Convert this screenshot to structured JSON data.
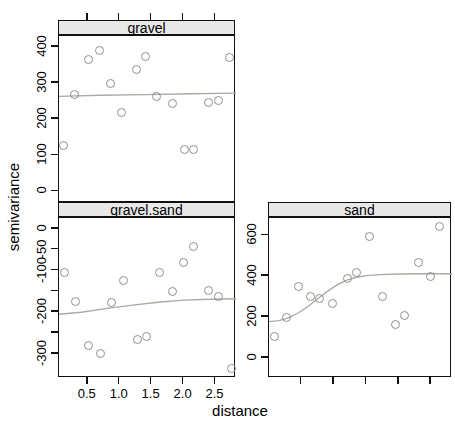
{
  "figure": {
    "xlab": "distance",
    "ylab": "semivariance"
  },
  "colors": {
    "point_stroke": "#8f8f8f",
    "model_line": "#a7ada0",
    "strip_bg": "#e8e8e8",
    "border": "#111111",
    "text": "#000000"
  },
  "chart_data": [
    {
      "type": "scatter",
      "panel_title": "gravel",
      "xlabel": "distance",
      "ylabel": "semivariance",
      "xlim": [
        0.05,
        2.82
      ],
      "ylim": [
        -32,
        430
      ],
      "x_ticks": [
        0.5,
        1.0,
        1.5,
        2.0,
        2.5
      ],
      "x_tick_labels": [
        "",
        "",
        "",
        "",
        ""
      ],
      "x_tick_side": "top",
      "y_ticks": [
        0,
        100,
        200,
        300,
        400
      ],
      "y_tick_labels": [
        "0",
        "100",
        "200",
        "300",
        "400"
      ],
      "grid": false,
      "points": [
        [
          0.13,
          125
        ],
        [
          0.3,
          268
        ],
        [
          0.52,
          364
        ],
        [
          0.69,
          389
        ],
        [
          0.86,
          298
        ],
        [
          1.03,
          218
        ],
        [
          1.27,
          337
        ],
        [
          1.41,
          372
        ],
        [
          1.59,
          260
        ],
        [
          1.83,
          243
        ],
        [
          2.02,
          114
        ],
        [
          2.16,
          114
        ],
        [
          2.39,
          246
        ],
        [
          2.55,
          251
        ],
        [
          2.73,
          369
        ]
      ],
      "model_line": [
        [
          0.05,
          263
        ],
        [
          0.7,
          266
        ],
        [
          1.4,
          268
        ],
        [
          2.1,
          270
        ],
        [
          2.82,
          272
        ]
      ]
    },
    {
      "type": "scatter",
      "panel_title": "gravel.sand",
      "xlabel": "distance",
      "ylabel": "semivariance",
      "xlim": [
        0.05,
        2.82
      ],
      "ylim": [
        -358,
        26
      ],
      "x_ticks": [
        0.5,
        1.0,
        1.5,
        2.0,
        2.5
      ],
      "x_tick_labels": [
        "0.5",
        "1.0",
        "1.5",
        "2.0",
        "2.5"
      ],
      "x_tick_side": "bottom",
      "y_ticks": [
        0,
        -50,
        -100,
        -150,
        -200,
        -250,
        -300
      ],
      "y_tick_labels": [
        "0",
        "-50",
        "-100",
        "",
        "-200",
        "",
        "-300"
      ],
      "grid": false,
      "points": [
        [
          0.14,
          -105
        ],
        [
          0.31,
          -175
        ],
        [
          0.52,
          -280
        ],
        [
          0.7,
          -300
        ],
        [
          0.88,
          -179
        ],
        [
          1.07,
          -125
        ],
        [
          1.28,
          -266
        ],
        [
          1.42,
          -260
        ],
        [
          1.63,
          -106
        ],
        [
          1.83,
          -151
        ],
        [
          2.01,
          -82
        ],
        [
          2.17,
          -43
        ],
        [
          2.4,
          -150
        ],
        [
          2.55,
          -163
        ],
        [
          2.75,
          -336
        ]
      ],
      "model_line": [
        [
          0.05,
          -205
        ],
        [
          0.4,
          -200
        ],
        [
          0.8,
          -191
        ],
        [
          1.2,
          -183
        ],
        [
          1.6,
          -176
        ],
        [
          2.0,
          -171
        ],
        [
          2.4,
          -169
        ],
        [
          2.82,
          -168
        ]
      ]
    },
    {
      "type": "scatter",
      "panel_title": "sand",
      "xlabel": "distance",
      "ylabel": "semivariance",
      "xlim": [
        0.0,
        2.82
      ],
      "ylim": [
        -98,
        685
      ],
      "x_ticks": [
        0.5,
        1.0,
        1.5,
        2.0,
        2.5
      ],
      "x_tick_labels": [
        "",
        "",
        "",
        "",
        ""
      ],
      "x_tick_side": "bottom",
      "y_ticks": [
        0,
        200,
        400,
        600
      ],
      "y_tick_labels": [
        "0",
        "200",
        "400",
        "600"
      ],
      "grid": false,
      "points": [
        [
          0.1,
          105
        ],
        [
          0.28,
          197
        ],
        [
          0.46,
          346
        ],
        [
          0.64,
          298
        ],
        [
          0.79,
          289
        ],
        [
          0.99,
          262
        ],
        [
          1.21,
          387
        ],
        [
          1.35,
          415
        ],
        [
          1.56,
          594
        ],
        [
          1.75,
          298
        ],
        [
          1.95,
          160
        ],
        [
          2.1,
          205
        ],
        [
          2.31,
          465
        ],
        [
          2.49,
          397
        ],
        [
          2.64,
          639
        ]
      ],
      "model_line": [
        [
          0.0,
          178
        ],
        [
          0.15,
          183
        ],
        [
          0.3,
          196
        ],
        [
          0.45,
          220
        ],
        [
          0.6,
          252
        ],
        [
          0.75,
          290
        ],
        [
          0.9,
          326
        ],
        [
          1.05,
          358
        ],
        [
          1.2,
          381
        ],
        [
          1.35,
          395
        ],
        [
          1.5,
          403
        ],
        [
          1.7,
          408
        ],
        [
          2.0,
          411
        ],
        [
          2.4,
          412
        ],
        [
          2.82,
          412
        ]
      ]
    }
  ]
}
